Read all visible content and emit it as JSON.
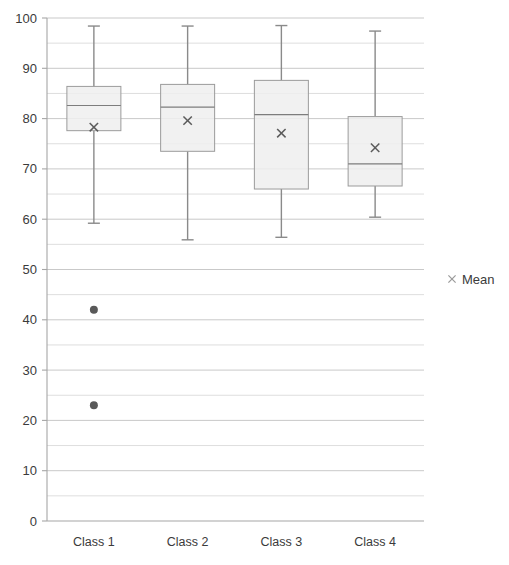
{
  "chart_data": {
    "type": "box",
    "title": "",
    "subtitle": "",
    "xlabel": "",
    "ylabel": "",
    "categories": [
      "Class 1",
      "Class 2",
      "Class 3",
      "Class 4"
    ],
    "ylim": [
      0,
      100
    ],
    "y_ticks": [
      0,
      10,
      20,
      30,
      40,
      50,
      60,
      70,
      80,
      90,
      100
    ],
    "y_tick_labels": [
      "0",
      "10",
      "20",
      "30",
      "40",
      "50",
      "60",
      "70",
      "80",
      "90",
      "100"
    ],
    "minor_gridlines": [
      5,
      15,
      25,
      35,
      45,
      55,
      65,
      75,
      85,
      95
    ],
    "grid": true,
    "grid_axis": "y",
    "legend": {
      "position": "right",
      "entries": [
        {
          "label": "Mean",
          "marker": "x",
          "color": "#9a9a9a"
        }
      ]
    },
    "boxes": [
      {
        "category": "Class 1",
        "min": 59.2,
        "q1": 77.6,
        "median": 82.6,
        "q3": 86.4,
        "max": 98.4,
        "mean": 78.3,
        "outliers": [
          42.0,
          23.0
        ]
      },
      {
        "category": "Class 2",
        "min": 55.9,
        "q1": 73.5,
        "median": 82.3,
        "q3": 86.8,
        "max": 98.4,
        "mean": 79.6,
        "outliers": []
      },
      {
        "category": "Class 3",
        "min": 56.4,
        "q1": 66.0,
        "median": 80.8,
        "q3": 87.6,
        "max": 98.5,
        "mean": 77.1,
        "outliers": []
      },
      {
        "category": "Class 4",
        "min": 60.4,
        "q1": 66.6,
        "median": 71.0,
        "q3": 80.4,
        "max": 97.4,
        "mean": 74.2,
        "outliers": []
      }
    ],
    "colors": {
      "box_fill": "#eeeeee",
      "box_stroke": "#9b9b9b",
      "whisker": "#8a8a8a",
      "median": "#7d7d7d",
      "mean_marker": "#5b5b5b",
      "outlier": "#595959",
      "grid_major": "#c9c9c9",
      "grid_minor": "#dedede",
      "axis": "#a6a6a6",
      "text": "#3b3b3b"
    }
  }
}
